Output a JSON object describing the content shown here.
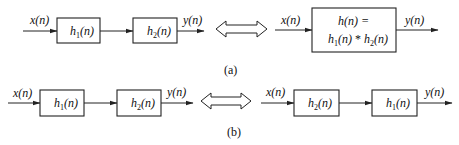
{
  "diagram": {
    "type": "block-diagram",
    "panels": [
      {
        "caption": "(a)",
        "left": {
          "input": "x(n)",
          "blocks": [
            {
              "name": "h",
              "sub": "1",
              "arg": "(n)"
            },
            {
              "name": "h",
              "sub": "2",
              "arg": "(n)"
            }
          ],
          "output": "y(n)"
        },
        "equivalence": "double-arrow",
        "right": {
          "input": "x(n)",
          "block_line1": "h(n) =",
          "block_line2": {
            "a": "h",
            "a_sub": "1",
            "a_arg": "(n)",
            "op": " * ",
            "b": "h",
            "b_sub": "2",
            "b_arg": "(n)"
          },
          "output": "y(n)"
        }
      },
      {
        "caption": "(b)",
        "left": {
          "input": "x(n)",
          "blocks": [
            {
              "name": "h",
              "sub": "1",
              "arg": "(n)"
            },
            {
              "name": "h",
              "sub": "2",
              "arg": "(n)"
            }
          ],
          "output": "y(n)"
        },
        "equivalence": "double-arrow",
        "right": {
          "input": "x(n)",
          "blocks": [
            {
              "name": "h",
              "sub": "2",
              "arg": "(n)"
            },
            {
              "name": "h",
              "sub": "1",
              "arg": "(n)"
            }
          ],
          "output": "y(n)"
        }
      }
    ]
  }
}
